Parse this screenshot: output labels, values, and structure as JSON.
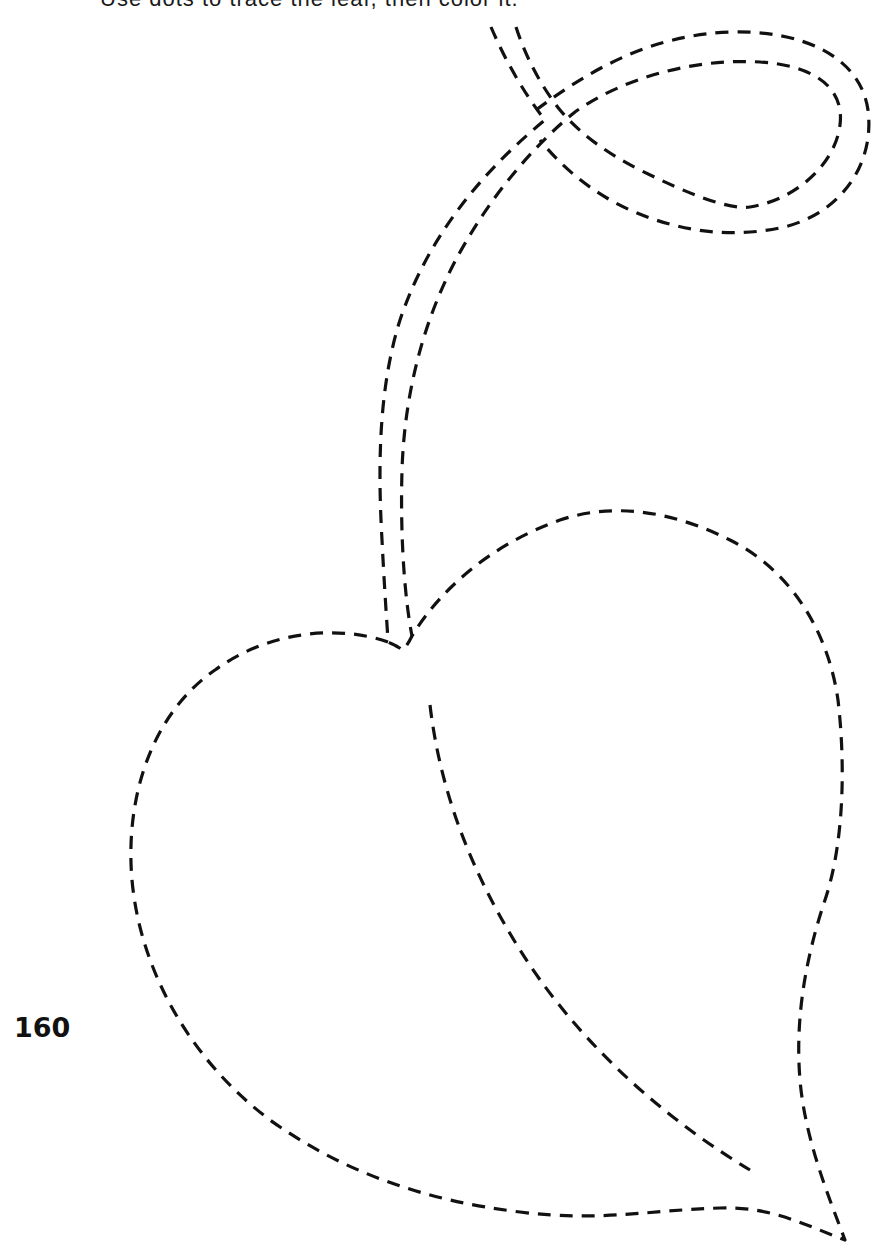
{
  "page": {
    "type": "tracing-worksheet",
    "top_caption": "Use dots to trace the leaf, then color it.",
    "page_number": "160"
  },
  "illustration": {
    "subject": "leaf-with-curled-stem",
    "line_style": "dashed",
    "line_color": "#111111",
    "background_color": "#ffffff",
    "parts": [
      {
        "name": "stem-outer-line",
        "label": "Stem outer edge"
      },
      {
        "name": "stem-inner-line",
        "label": "Stem inner edge"
      },
      {
        "name": "stem-loop",
        "label": "Stem loop"
      },
      {
        "name": "leaf-outline",
        "label": "Leaf outline"
      },
      {
        "name": "leaf-midrib",
        "label": "Leaf midrib"
      }
    ]
  }
}
